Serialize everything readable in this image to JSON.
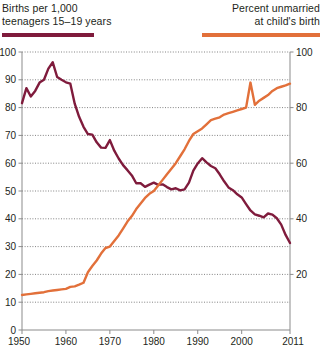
{
  "legend": {
    "left": {
      "label_line1": "Births per 1,000",
      "label_line2": "teenagers 15–19 years",
      "color": "#7f1b3c",
      "swatch_name": "legend-swatch-teen-birth-rate"
    },
    "right": {
      "label_line1": "Percent unmarried",
      "label_line2": "at child's birth",
      "color": "#e2703a",
      "swatch_name": "legend-swatch-percent-unmarried"
    }
  },
  "chart_data": {
    "type": "line",
    "title": "",
    "subtitle": "",
    "xlabel": "",
    "ylabel": "Births per 1,000 teenagers 15–19 years",
    "y2label": "Percent unmarried at child's birth",
    "grid": true,
    "legend_position": "top",
    "xlim": [
      1950,
      2011
    ],
    "ylim": [
      0,
      100
    ],
    "y2lim": [
      0,
      100
    ],
    "xticks": [
      1950,
      1960,
      1970,
      1980,
      1990,
      2000,
      2011
    ],
    "xticklabels": [
      "1950",
      "1960",
      "1970",
      "1980",
      "1990",
      "2000",
      "2011"
    ],
    "yticks": [
      0,
      10,
      20,
      30,
      40,
      50,
      60,
      70,
      80,
      90,
      100
    ],
    "yticklabels": [
      "0",
      "10",
      "20",
      "30",
      "40",
      "50",
      "60",
      "70",
      "80",
      "90",
      "100"
    ],
    "y2ticks": [
      20,
      40,
      60,
      80,
      100
    ],
    "y2ticklabels": [
      "20",
      "40",
      "60",
      "80",
      "100"
    ],
    "series": [
      {
        "name": "Births per 1,000 teenagers 15–19 years",
        "color": "#7f1b3c",
        "axis": "left",
        "x": [
          1950,
          1951,
          1952,
          1953,
          1954,
          1955,
          1956,
          1957,
          1958,
          1959,
          1960,
          1961,
          1962,
          1963,
          1964,
          1965,
          1966,
          1967,
          1968,
          1969,
          1970,
          1971,
          1972,
          1973,
          1974,
          1975,
          1976,
          1977,
          1978,
          1979,
          1980,
          1981,
          1982,
          1983,
          1984,
          1985,
          1986,
          1987,
          1988,
          1989,
          1990,
          1991,
          1992,
          1993,
          1994,
          1995,
          1996,
          1997,
          1998,
          1999,
          2000,
          2001,
          2002,
          2003,
          2004,
          2005,
          2006,
          2007,
          2008,
          2009,
          2010,
          2011
        ],
        "values": [
          81.6,
          87.0,
          84.0,
          86.0,
          89.0,
          90.0,
          94.0,
          96.3,
          91.0,
          90.0,
          89.1,
          88.6,
          81.4,
          76.7,
          73.1,
          70.5,
          70.3,
          67.5,
          65.6,
          65.5,
          68.3,
          64.5,
          61.7,
          59.3,
          57.5,
          55.6,
          52.8,
          52.8,
          51.5,
          52.3,
          53.0,
          52.2,
          52.4,
          51.4,
          50.6,
          51.0,
          50.2,
          50.6,
          53.0,
          57.3,
          59.9,
          61.8,
          60.3,
          59.0,
          58.2,
          56.0,
          53.5,
          51.3,
          50.3,
          48.8,
          47.7,
          45.3,
          43.0,
          41.6,
          41.1,
          40.5,
          41.9,
          41.5,
          40.2,
          37.9,
          34.2,
          31.3
        ]
      },
      {
        "name": "Percent unmarried at child's birth",
        "color": "#e2703a",
        "axis": "right",
        "x": [
          1950,
          1951,
          1952,
          1953,
          1954,
          1955,
          1956,
          1957,
          1958,
          1959,
          1960,
          1961,
          1962,
          1963,
          1964,
          1965,
          1966,
          1967,
          1968,
          1969,
          1970,
          1971,
          1972,
          1973,
          1974,
          1975,
          1976,
          1977,
          1978,
          1979,
          1980,
          1981,
          1982,
          1983,
          1984,
          1985,
          1986,
          1987,
          1988,
          1989,
          1990,
          1991,
          1992,
          1993,
          1994,
          1995,
          1996,
          1997,
          1998,
          1999,
          2000,
          2001,
          2002,
          2003,
          2004,
          2005,
          2006,
          2007,
          2008,
          2009,
          2010,
          2011
        ],
        "values": [
          12.6,
          12.8,
          13.0,
          13.2,
          13.4,
          13.6,
          14.0,
          14.2,
          14.4,
          14.6,
          14.8,
          15.5,
          15.7,
          16.3,
          17.0,
          20.8,
          23.0,
          25.0,
          27.5,
          29.5,
          30.0,
          32.0,
          34.0,
          36.5,
          39.0,
          41.0,
          43.5,
          45.5,
          47.5,
          49.0,
          50.0,
          52.0,
          54.0,
          56.0,
          58.0,
          60.0,
          62.5,
          65.0,
          68.0,
          70.5,
          71.5,
          72.5,
          74.0,
          75.5,
          76.0,
          76.5,
          77.5,
          78.0,
          78.5,
          79.0,
          79.5,
          80.0,
          89.0,
          81.0,
          82.5,
          83.5,
          84.5,
          86.0,
          87.0,
          87.5,
          88.0,
          88.6
        ]
      }
    ]
  }
}
